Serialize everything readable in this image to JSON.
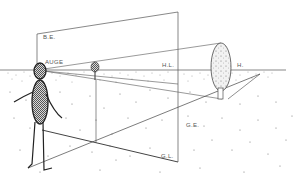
{
  "diagram": {
    "type": "perspective-construction",
    "labels": {
      "picture_plane": "B.E.",
      "eye": "AUGE",
      "horizon_line": "H.L.",
      "horizon_point": "H.",
      "ground_plane": "G.E.",
      "ground_line": "G.L."
    },
    "elements": [
      {
        "name": "observer-figure",
        "description": "stick figure with stippled head and body standing at left"
      },
      {
        "name": "picture-plane",
        "description": "vertical rectangle plane between observer and objects"
      },
      {
        "name": "small-tree",
        "description": "small tree on horizon near picture plane"
      },
      {
        "name": "large-tree",
        "description": "larger oval tree beyond picture plane"
      },
      {
        "name": "ground-plane",
        "description": "stippled ground surface below horizon"
      }
    ],
    "colors": {
      "line": "#444444",
      "text": "#555555",
      "background": "#ffffff"
    }
  }
}
